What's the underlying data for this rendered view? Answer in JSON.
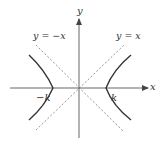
{
  "diagram": {
    "type": "hyperbola",
    "equation_family": "x^2 - y^2 = k^2",
    "axes": {
      "x_label": "x",
      "y_label": "y"
    },
    "asymptotes": [
      {
        "label": "y = −x",
        "style": "dashed"
      },
      {
        "label": "y = x",
        "style": "dashed"
      }
    ],
    "vertices": [
      {
        "label": "−k"
      },
      {
        "label": "k"
      }
    ],
    "colors": {
      "axis": "#555555",
      "curve": "#333333",
      "asymptote": "#777777",
      "text": "#333333"
    }
  }
}
